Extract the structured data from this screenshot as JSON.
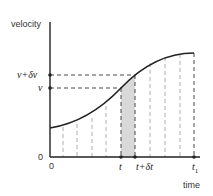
{
  "diagram": {
    "type": "velocity-time graph",
    "axes": {
      "y_label": "velocity",
      "x_label": "time",
      "origin_x_label": "0",
      "origin_y_label": "0"
    },
    "y_markers": [
      {
        "label": "v+δv",
        "y": 75
      },
      {
        "label": "v",
        "y": 88
      }
    ],
    "x_markers": [
      {
        "label": "t",
        "x": 121
      },
      {
        "label": "t+δt",
        "x": 135
      },
      {
        "label": "t",
        "subscript": "1",
        "x": 194
      }
    ],
    "shaded_strip": {
      "from": "t",
      "to": "t+δt",
      "color": "#d9d9d9"
    },
    "colors": {
      "curve": "#222222",
      "axis": "#222222",
      "dashed": "#888888",
      "shade": "#d9d9d9"
    }
  }
}
